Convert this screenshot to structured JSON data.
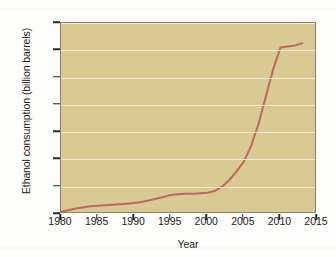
{
  "figure": {
    "background_color": "#fdfdfb",
    "plot_background_color": "#d8ca92",
    "gridline_color": "#f3ecd2",
    "frame_color": "#8b8466",
    "line_color": "#c0655f"
  },
  "chart_data": {
    "type": "line",
    "title": "",
    "xlabel": "Year",
    "ylabel": "Ethanol consumption (billion barrels)",
    "xlim": [
      1980,
      2015
    ],
    "ylim": [
      0,
      350
    ],
    "grid": true,
    "legend": null,
    "xticks": [
      1980,
      1985,
      1990,
      1995,
      2000,
      2005,
      2010,
      2015
    ],
    "xtick_labels": [
      "1980",
      "1985",
      "1990",
      "1995",
      "2000",
      "2005",
      "2010",
      "2015"
    ],
    "yticks": [
      0,
      50,
      100,
      150,
      200,
      250,
      300,
      350
    ],
    "ytick_labels": [
      "0",
      "50",
      "100",
      "150",
      "200",
      "250",
      "300",
      "350"
    ],
    "series": [
      {
        "name": "Ethanol consumption",
        "color": "#c0655f",
        "x": [
          1980,
          1981,
          1982,
          1983,
          1984,
          1985,
          1986,
          1987,
          1988,
          1989,
          1990,
          1991,
          1992,
          1993,
          1994,
          1995,
          1996,
          1997,
          1998,
          1999,
          2000,
          2001,
          2002,
          2003,
          2004,
          2005,
          2006,
          2007,
          2008,
          2009,
          2010,
          2011,
          2012,
          2013
        ],
        "values": [
          4,
          7,
          10,
          12,
          14,
          15,
          16,
          17,
          18,
          19,
          20,
          22,
          25,
          28,
          31,
          35,
          36,
          37,
          37,
          38,
          39,
          42,
          50,
          62,
          78,
          96,
          125,
          165,
          215,
          265,
          305,
          307,
          309,
          313
        ]
      }
    ]
  }
}
